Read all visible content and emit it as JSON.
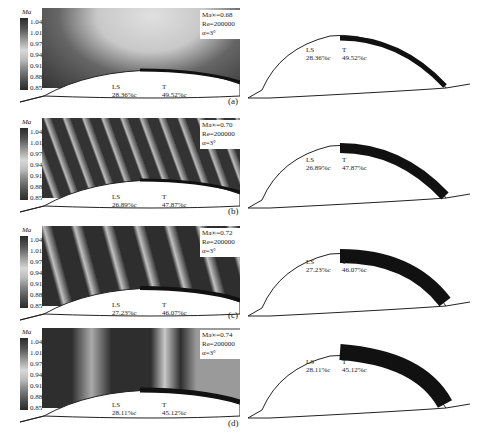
{
  "figure": {
    "colorbar": {
      "title": "Ma",
      "ticks": [
        "1.04",
        "1.01",
        "0.97",
        "0.94",
        "0.91",
        "0.88",
        "0.85"
      ]
    },
    "panels": [
      {
        "label": "(a)",
        "mach": "Ma∞=0.68",
        "re": "Re=200000",
        "alpha": "α=3°",
        "ls_label": "LS",
        "ls_value": "28.36%c",
        "t_label": "T",
        "t_value": "49.52%c"
      },
      {
        "label": "(b)",
        "mach": "Ma∞=0.70",
        "re": "Re=200000",
        "alpha": "α=3°",
        "ls_label": "LS",
        "ls_value": "26.89%c",
        "t_label": "T",
        "t_value": "47.87%c"
      },
      {
        "label": "(c)",
        "mach": "Ma∞=0.72",
        "re": "Re=200000",
        "alpha": "α=3°",
        "ls_label": "LS",
        "ls_value": "27.23%c",
        "t_label": "T",
        "t_value": "46.07%c"
      },
      {
        "label": "(d)",
        "mach": "Ma∞=0.74",
        "re": "Re=200000",
        "alpha": "α=3°",
        "ls_label": "LS",
        "ls_value": "28.11%c",
        "t_label": "T",
        "t_value": "45.12%c"
      }
    ]
  }
}
